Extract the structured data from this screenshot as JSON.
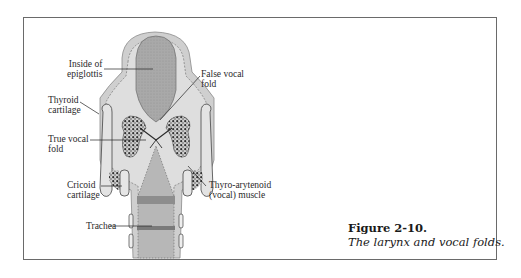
{
  "figure": {
    "number": "Figure 2-10.",
    "caption": "The larynx and vocal folds."
  },
  "labels": {
    "epiglottis": {
      "line1": "Inside of",
      "line2": "epiglottis"
    },
    "false_fold": {
      "line1": "False vocal",
      "line2": "fold"
    },
    "thyroid": {
      "line1": "Thyroid",
      "line2": "cartilage"
    },
    "true_fold": {
      "line1": "True vocal",
      "line2": "fold"
    },
    "cricoid": {
      "line1": "Cricoid",
      "line2": "cartilage"
    },
    "thyro": {
      "line1": "Thyro-arytenoid",
      "line2": "(vocal) muscle"
    },
    "trachea": {
      "line1": "Trachea"
    }
  },
  "colors": {
    "border": "#6a6a6a",
    "tissue": "#c9c9c9",
    "epiglottis": "#a9a9a9",
    "trachea_band": "#8a8a8a",
    "muscle": "#3a3a3a"
  }
}
